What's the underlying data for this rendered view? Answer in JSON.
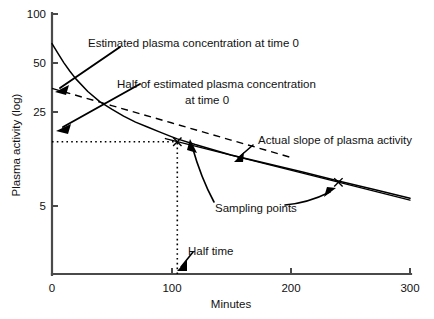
{
  "chart_data": {
    "type": "line",
    "title": "",
    "xlabel": "Minutes",
    "ylabel": "Plasma activity (log)",
    "xlim": [
      0,
      300
    ],
    "ylim": [
      3.4,
      100
    ],
    "yscale": "log",
    "xscale": "linear",
    "grid": false,
    "legend_position": "none",
    "xticks": [
      0,
      100,
      200,
      300
    ],
    "xtick_labels": [
      "0",
      "100",
      "200",
      "300"
    ],
    "yticks": [
      5,
      25,
      50,
      100
    ],
    "ytick_labels": [
      "5",
      "25",
      "50",
      "100"
    ],
    "series": [
      {
        "name": "Actual plasma activity curve",
        "style": "solid",
        "x": [
          0,
          5,
          10,
          15,
          20,
          30,
          40,
          50,
          60,
          70,
          80,
          90,
          100,
          105,
          120,
          150,
          180,
          210,
          240,
          270,
          300
        ],
        "y": [
          68.0,
          60.0,
          53.0,
          47.5,
          43.0,
          36.5,
          32.0,
          29.0,
          26.5,
          24.5,
          23.0,
          21.6,
          20.3,
          19.7,
          18.3,
          16.0,
          14.3,
          12.8,
          11.4,
          10.2,
          9.1
        ]
      },
      {
        "name": "Estimated plasma concentration extrapolation",
        "style": "dashed",
        "x": [
          0,
          50,
          100,
          150,
          200
        ],
        "y": [
          38.0,
          30.4,
          24.3,
          19.4,
          15.5
        ]
      },
      {
        "name": "Actual slope of plasma activity",
        "style": "thin-solid",
        "x": [
          95,
          300
        ],
        "y": [
          19.8,
          8.9
        ]
      }
    ],
    "sampling_points": {
      "marker": "x",
      "x": [
        105,
        240
      ],
      "y": [
        19.0,
        11.2
      ]
    },
    "guides": [
      {
        "name": "half-concentration-horizontal",
        "style": "dotted",
        "orientation": "horizontal",
        "y": 19.0,
        "x_from": 0,
        "x_to": 105
      },
      {
        "name": "half-time-vertical",
        "style": "dotted",
        "orientation": "vertical",
        "x": 105,
        "y_from": 3.4,
        "y_to": 19.0
      }
    ],
    "annotations": [
      {
        "id": "estimated-plasma-concentration",
        "lines": [
          "Estimated plasma concentration at time 0"
        ],
        "points_to": {
          "x": 0,
          "y": 38.0
        }
      },
      {
        "id": "half-of-estimated-plasma-concentration",
        "lines": [
          "Half of estimated plasma concentration",
          "at time 0"
        ],
        "points_to": {
          "x": 0,
          "y": 19.0
        }
      },
      {
        "id": "actual-slope-of-plasma-activity",
        "lines": [
          "Actual slope of plasma activity"
        ],
        "points_to": {
          "x": 150,
          "y": 15.2
        }
      },
      {
        "id": "sampling-points",
        "lines": [
          "Sampling points"
        ],
        "points_to": {
          "x": 240,
          "y": 11.2
        }
      },
      {
        "id": "half-time",
        "lines": [
          "Half time"
        ],
        "points_to": {
          "x": 105,
          "y": 4.0
        }
      }
    ]
  },
  "axes": {
    "y_title": "Plasma activity (log)",
    "x_title": "Minutes",
    "y_ticks": [
      {
        "label": "100"
      },
      {
        "label": "50"
      },
      {
        "label": "25"
      },
      {
        "label": "5"
      }
    ],
    "x_ticks": [
      {
        "label": "0"
      },
      {
        "label": "100"
      },
      {
        "label": "200"
      },
      {
        "label": "300"
      }
    ]
  },
  "annotations": {
    "estimated_line1": "Estimated plasma concentration at time 0",
    "half_line1": "Half of estimated plasma concentration",
    "half_line2": "at time 0",
    "actual_slope": "Actual slope of plasma activity",
    "sampling_points": "Sampling points",
    "half_time": "Half time"
  },
  "colors": {
    "axis": "#4a4a4a",
    "ink": "#000000",
    "background": "#ffffff"
  }
}
